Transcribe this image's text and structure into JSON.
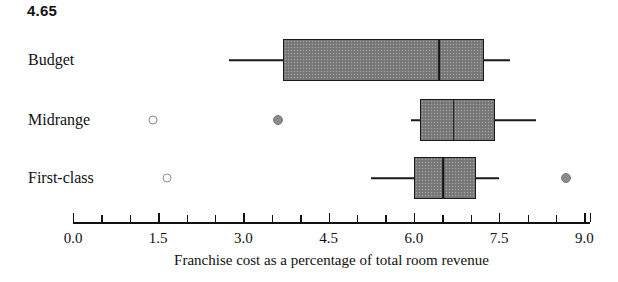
{
  "header": {
    "value": "4.65"
  },
  "chart_data": {
    "type": "box",
    "orientation": "horizontal",
    "title": "",
    "xlabel": "Franchise cost as a percentage of total room revenue",
    "ylabel": "",
    "xlim": [
      0.0,
      9.1
    ],
    "xticks_major": [
      "0.0",
      "1.5",
      "3.0",
      "4.5",
      "6.0",
      "7.5",
      "9.0"
    ],
    "xtick_major_values": [
      0.0,
      1.5,
      3.0,
      4.5,
      6.0,
      7.5,
      9.0
    ],
    "xtick_minor_values": [
      0.5,
      1.0,
      2.0,
      2.5,
      3.5,
      4.0,
      5.0,
      5.5,
      6.5,
      7.0,
      8.0,
      8.5
    ],
    "grid": false,
    "legend": "none",
    "categories": [
      "Budget",
      "Midrange",
      "First-class"
    ],
    "boxes": [
      {
        "category": "Budget",
        "whisker_low": 2.75,
        "q1": 3.7,
        "median": 6.45,
        "q3": 7.2,
        "whisker_high": 7.7,
        "outliers_open": [],
        "outliers_filled": []
      },
      {
        "category": "Midrange",
        "whisker_low": 5.95,
        "q1": 6.1,
        "median": 6.7,
        "q3": 7.4,
        "whisker_high": 8.15,
        "outliers_open": [
          1.4
        ],
        "outliers_filled": [
          3.6
        ]
      },
      {
        "category": "First-class",
        "whisker_low": 5.25,
        "q1": 6.0,
        "median": 6.52,
        "q3": 7.05,
        "whisker_high": 7.5,
        "outliers_open": [
          1.65
        ],
        "outliers_filled": [
          8.68
        ]
      }
    ],
    "colors": {
      "box_fill": "#7d7d7d",
      "box_edge": "#1a1a1a",
      "median": "#141414",
      "outlier_open": "#8e8e8e",
      "outlier_filled": "#8a8a8a",
      "axis": "#111111"
    }
  }
}
